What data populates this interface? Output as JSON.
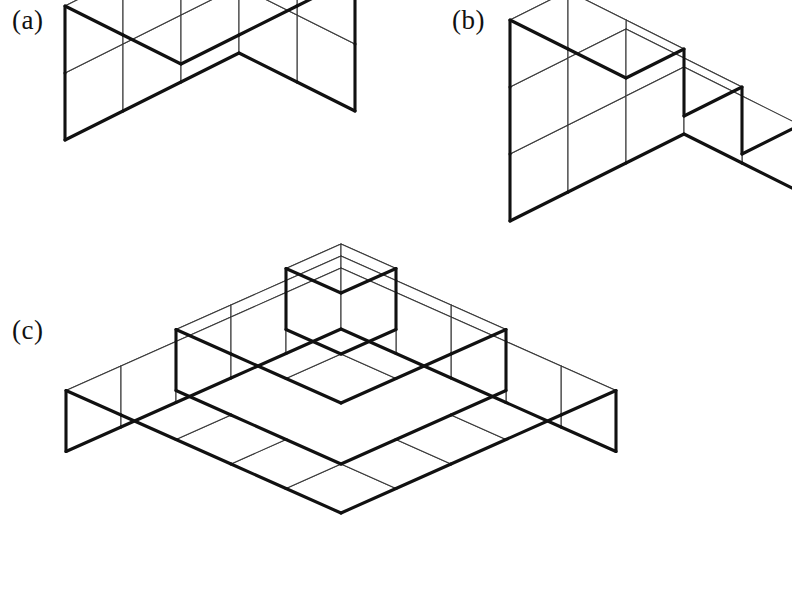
{
  "page": {
    "background_color": "#ffffff",
    "width": 792,
    "height": 610
  },
  "style": {
    "face_fill": "#ffffff",
    "interior_line_color": "#3a3a3a",
    "interior_line_width": 1.1,
    "outline_color": "#111111",
    "outline_width": 3.1
  },
  "figures": [
    {
      "id": "a",
      "label": "(a)",
      "description": "Solid rectangular box of unit cubes, 3 wide by 2 deep by 2 tall",
      "shape": "box",
      "dims": {
        "nx": 3,
        "ny": 2,
        "nz": 2
      },
      "cube_count": 12,
      "origin": {
        "x": 181,
        "y": 198
      },
      "cube_size": 58,
      "iso": {
        "dx": 58,
        "dy": 29,
        "dz": 67
      },
      "columns": [
        {
          "col": 0,
          "row": 0,
          "height": 2
        },
        {
          "col": 1,
          "row": 0,
          "height": 2
        },
        {
          "col": 2,
          "row": 0,
          "height": 2
        },
        {
          "col": 0,
          "row": 1,
          "height": 2
        },
        {
          "col": 1,
          "row": 1,
          "height": 2
        },
        {
          "col": 2,
          "row": 1,
          "height": 2
        }
      ]
    },
    {
      "id": "b",
      "label": "(b)",
      "description": "Three-tier staircase of unit cubes, 3 wide by 2 deep, column heights 1, 2, 3",
      "shape": "staircase",
      "dims": {
        "nx": 3,
        "ny": 2,
        "nz": 3
      },
      "cube_count": 12,
      "origin": {
        "x": 626,
        "y": 279
      },
      "cube_size": 58,
      "iso": {
        "dx": 58,
        "dy": 29,
        "dz": 67
      },
      "columns": [
        {
          "col": 0,
          "row": 0,
          "height": 3
        },
        {
          "col": 1,
          "row": 0,
          "height": 2
        },
        {
          "col": 2,
          "row": 0,
          "height": 1
        },
        {
          "col": 0,
          "row": 1,
          "height": 3
        },
        {
          "col": 1,
          "row": 1,
          "height": 2
        },
        {
          "col": 2,
          "row": 1,
          "height": 1
        }
      ]
    },
    {
      "id": "c",
      "label": "(c)",
      "description": "Stepped pyramid of unit cubes: 5 by 5 base layer, 3 by 3 middle layer, single cube on top",
      "shape": "step-pyramid",
      "dims": {
        "nx": 5,
        "ny": 5,
        "nz": 3
      },
      "cube_count": 35,
      "layer_sizes": [
        25,
        9,
        1
      ],
      "origin": {
        "x": 341,
        "y": 574
      },
      "cube_size": 55,
      "iso": {
        "dx": 55,
        "dy": 24.5,
        "dz": 61
      },
      "columns": [
        {
          "col": 0,
          "row": 0,
          "height": 1
        },
        {
          "col": 1,
          "row": 0,
          "height": 1
        },
        {
          "col": 2,
          "row": 0,
          "height": 1
        },
        {
          "col": 3,
          "row": 0,
          "height": 1
        },
        {
          "col": 4,
          "row": 0,
          "height": 1
        },
        {
          "col": 0,
          "row": 1,
          "height": 1
        },
        {
          "col": 1,
          "row": 1,
          "height": 2
        },
        {
          "col": 2,
          "row": 1,
          "height": 2
        },
        {
          "col": 3,
          "row": 1,
          "height": 2
        },
        {
          "col": 4,
          "row": 1,
          "height": 1
        },
        {
          "col": 0,
          "row": 2,
          "height": 1
        },
        {
          "col": 1,
          "row": 2,
          "height": 2
        },
        {
          "col": 2,
          "row": 2,
          "height": 3
        },
        {
          "col": 3,
          "row": 2,
          "height": 2
        },
        {
          "col": 4,
          "row": 2,
          "height": 1
        },
        {
          "col": 0,
          "row": 3,
          "height": 1
        },
        {
          "col": 1,
          "row": 3,
          "height": 2
        },
        {
          "col": 2,
          "row": 3,
          "height": 2
        },
        {
          "col": 3,
          "row": 3,
          "height": 2
        },
        {
          "col": 4,
          "row": 3,
          "height": 1
        },
        {
          "col": 0,
          "row": 4,
          "height": 1
        },
        {
          "col": 1,
          "row": 4,
          "height": 1
        },
        {
          "col": 2,
          "row": 4,
          "height": 1
        },
        {
          "col": 3,
          "row": 4,
          "height": 1
        },
        {
          "col": 4,
          "row": 4,
          "height": 1
        }
      ]
    }
  ]
}
